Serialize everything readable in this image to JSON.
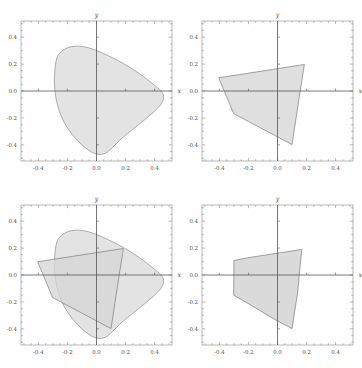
{
  "figure": {
    "title": "",
    "background_color": "#ffffff",
    "panel_count": 4,
    "layout": "2x2 grid of cartesian plots"
  },
  "style": {
    "frame_color": "#9a9a9a",
    "axis_color": "#555555",
    "blob_fill": "#dedede",
    "blob_stroke": "#8c8c8c",
    "polygon_fill": "#d6d6d6",
    "polygon_stroke": "#7d7d7d",
    "overlap_fill": "#b9b9b9",
    "tick_color": "#8a8a8a",
    "label_color": "#4a4a4a"
  },
  "axes": {
    "x_label": "x",
    "y_label": "y",
    "x_ticks": [
      "-0.4",
      "-0.2",
      "0.0",
      "0.2",
      "0.4"
    ],
    "y_ticks": [
      "0.4",
      "0.2",
      "0.0",
      "-0.2",
      "-0.4"
    ],
    "x_tick_values": [
      -0.4,
      -0.2,
      0.0,
      0.2,
      0.4
    ],
    "y_tick_values": [
      0.4,
      0.2,
      0.0,
      -0.2,
      -0.4
    ],
    "xlim": [
      -0.52,
      0.52
    ],
    "ylim": [
      -0.52,
      0.52
    ],
    "minor_ticks": true,
    "grid": false
  },
  "chart_data": {
    "type": "scatter",
    "title": "",
    "xlabel": "x",
    "ylabel": "y",
    "xlim": [
      -0.52,
      0.52
    ],
    "ylim": [
      -0.52,
      0.52
    ],
    "grid": false,
    "legend": "none",
    "panels": [
      {
        "index": 0,
        "position": "top-left",
        "description": "Convex blob region only",
        "shapes": [
          "blob"
        ]
      },
      {
        "index": 1,
        "position": "top-right",
        "description": "Convex polygon region only",
        "shapes": [
          "polygon"
        ]
      },
      {
        "index": 2,
        "position": "bottom-left",
        "description": "Blob and polygon overlaid, overlap shaded darker",
        "shapes": [
          "blob",
          "polygon"
        ]
      },
      {
        "index": 3,
        "position": "bottom-right",
        "description": "Intersection of blob and polygon",
        "shapes": [
          "intersection"
        ]
      }
    ],
    "regions": {
      "blob": {
        "name": "convex blob",
        "closed": true,
        "smooth": true,
        "points": [
          [
            -0.285,
            0.175
          ],
          [
            -0.268,
            0.258
          ],
          [
            -0.228,
            0.305
          ],
          [
            -0.17,
            0.33
          ],
          [
            -0.095,
            0.33
          ],
          [
            -0.01,
            0.305
          ],
          [
            0.09,
            0.258
          ],
          [
            0.2,
            0.195
          ],
          [
            0.3,
            0.125
          ],
          [
            0.385,
            0.055
          ],
          [
            0.445,
            0.0
          ],
          [
            0.462,
            -0.04
          ],
          [
            0.45,
            -0.09
          ],
          [
            0.4,
            -0.15
          ],
          [
            0.33,
            -0.215
          ],
          [
            0.25,
            -0.285
          ],
          [
            0.175,
            -0.35
          ],
          [
            0.11,
            -0.42
          ],
          [
            0.062,
            -0.462
          ],
          [
            0.015,
            -0.47
          ],
          [
            -0.04,
            -0.45
          ],
          [
            -0.105,
            -0.395
          ],
          [
            -0.17,
            -0.32
          ],
          [
            -0.225,
            -0.23
          ],
          [
            -0.262,
            -0.13
          ],
          [
            -0.282,
            -0.035
          ],
          [
            -0.29,
            0.06
          ]
        ]
      },
      "polygon": {
        "name": "convex polygon",
        "closed": true,
        "smooth": false,
        "vertices": [
          [
            -0.405,
            0.098
          ],
          [
            0.185,
            0.197
          ],
          [
            0.152,
            -0.03
          ],
          [
            0.1,
            -0.398
          ],
          [
            -0.302,
            -0.168
          ]
        ]
      },
      "intersection": {
        "name": "intersection of blob and polygon",
        "closed": true,
        "smooth": false,
        "vertices": [
          [
            -0.3,
            0.108
          ],
          [
            -0.205,
            0.128
          ],
          [
            0.06,
            0.172
          ],
          [
            0.168,
            0.19
          ],
          [
            0.152,
            0.03
          ],
          [
            0.14,
            -0.12
          ],
          [
            0.1,
            -0.398
          ],
          [
            -0.02,
            -0.33
          ],
          [
            -0.15,
            -0.245
          ],
          [
            -0.245,
            -0.185
          ],
          [
            -0.302,
            -0.15
          ]
        ]
      }
    }
  }
}
